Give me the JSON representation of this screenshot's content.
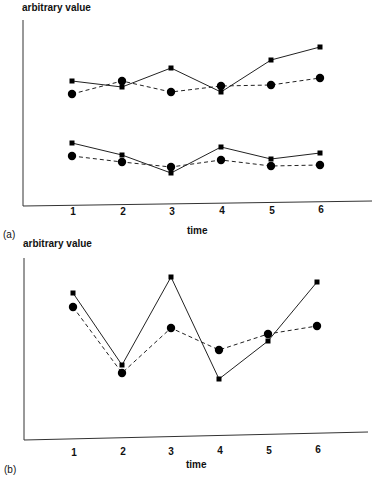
{
  "chart_data": [
    {
      "panel": "(a)",
      "type": "line",
      "title": "",
      "xlabel": "time",
      "ylabel": "arbitrary value",
      "categories": [
        1,
        2,
        3,
        4,
        5,
        6
      ],
      "grid": false,
      "legend": null,
      "series": [
        {
          "name": "upper-square-solid",
          "marker": "square",
          "line": "solid",
          "values": [
            6.8,
            6.5,
            7.5,
            6.2,
            7.9,
            8.6
          ]
        },
        {
          "name": "upper-circle-dashed",
          "marker": "circle",
          "line": "dashed",
          "values": [
            6.1,
            6.8,
            6.2,
            6.5,
            6.6,
            7.0
          ]
        },
        {
          "name": "lower-square-solid",
          "marker": "square",
          "line": "solid",
          "values": [
            3.3,
            2.7,
            1.7,
            3.1,
            2.5,
            2.8
          ]
        },
        {
          "name": "lower-circle-dashed",
          "marker": "circle",
          "line": "dashed",
          "values": [
            2.7,
            2.4,
            2.1,
            2.5,
            2.2,
            2.2
          ]
        }
      ],
      "px": {
        "x": [
          72,
          122,
          171,
          221,
          271,
          320
        ],
        "series_y": [
          [
            81,
            87,
            68,
            92,
            60,
            47
          ],
          [
            94,
            81,
            92,
            86,
            85,
            78
          ],
          [
            143,
            155,
            173,
            147,
            159,
            153
          ],
          [
            156,
            162,
            167,
            160,
            166,
            165
          ]
        ]
      }
    },
    {
      "panel": "(b)",
      "type": "line",
      "title": "",
      "xlabel": "time",
      "ylabel": "arbitrary value",
      "categories": [
        1,
        2,
        3,
        4,
        5,
        6
      ],
      "grid": false,
      "legend": null,
      "series": [
        {
          "name": "square-solid",
          "marker": "square",
          "line": "solid",
          "values": [
            8.1,
            4.1,
            9.0,
            3.3,
            5.4,
            8.7
          ]
        },
        {
          "name": "circle-dashed",
          "marker": "circle",
          "line": "dashed",
          "values": [
            7.3,
            3.6,
            6.1,
            4.9,
            5.8,
            6.2
          ]
        }
      ],
      "px": {
        "x": [
          73,
          122,
          171,
          219,
          268,
          317
        ],
        "series_y": [
          [
            293,
            365,
            277,
            379,
            341,
            282
          ],
          [
            307,
            373,
            328,
            350,
            334,
            326
          ]
        ]
      }
    }
  ],
  "labels": {
    "a": {
      "panel": "(a)",
      "ylabel": "arbitrary value",
      "xlabel": "time",
      "ticks": [
        "1",
        "2",
        "3",
        "4",
        "5",
        "6"
      ]
    },
    "b": {
      "panel": "(b)",
      "ylabel": "arbitrary value",
      "xlabel": "time",
      "ticks": [
        "1",
        "2",
        "3",
        "4",
        "5",
        "6"
      ]
    }
  }
}
